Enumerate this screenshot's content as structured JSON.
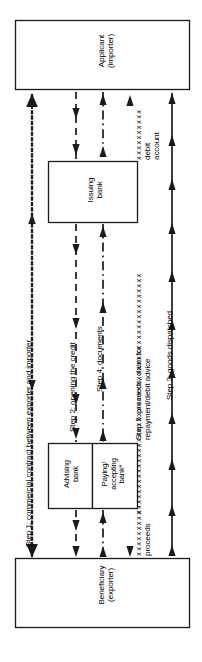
{
  "diagram": {
    "orientation": "rotated-90-ccw",
    "colors": {
      "stroke": "#1a1a1a",
      "background": "#ffffff",
      "text": "#000000"
    },
    "nodes": [
      {
        "id": "applicant",
        "label_line1": "Applicant",
        "label_line2": "(importer)"
      },
      {
        "id": "issuing",
        "label_line1": "Issuing",
        "label_line2": "bank"
      },
      {
        "id": "advising",
        "label_line1": "Advising",
        "label_line2": "bank"
      },
      {
        "id": "paying",
        "label_line1": "Paying/",
        "label_line2": "accepting",
        "label_line3": "bank*"
      },
      {
        "id": "beneficiary",
        "label_line1": "Beneficiary",
        "label_line2": "(exporter)"
      }
    ],
    "flows": [
      {
        "id": "step1",
        "label": "Step 1: commercial contract between exporter and importer",
        "line_style": "dotted",
        "from": "beneficiary",
        "to": "applicant",
        "arrows": "both"
      },
      {
        "id": "step2",
        "label": "Step 2: opening the credit",
        "line_style": "dashed",
        "from": "applicant",
        "to": "beneficiary",
        "arrows": "down"
      },
      {
        "id": "step4",
        "label": "Step 4: documents",
        "line_style": "dash-dot",
        "from": "beneficiary",
        "to": "applicant",
        "arrows": "up"
      },
      {
        "id": "step5",
        "label": "Step 5: proceeds, claim for repayment/debit advice",
        "line_style": "crosses",
        "from": "applicant",
        "to": "beneficiary",
        "arrows": "down",
        "endpoint_note_top": "debit account",
        "endpoint_note_bottom": "proceeds"
      },
      {
        "id": "step3",
        "label": "Step 3: goods dispatched",
        "line_style": "solid",
        "from": "beneficiary",
        "to": "applicant",
        "arrows": "up"
      }
    ],
    "annotations": {
      "debit_account": "debit account",
      "proceeds": "proceeds",
      "footnote_marker": "*"
    }
  }
}
